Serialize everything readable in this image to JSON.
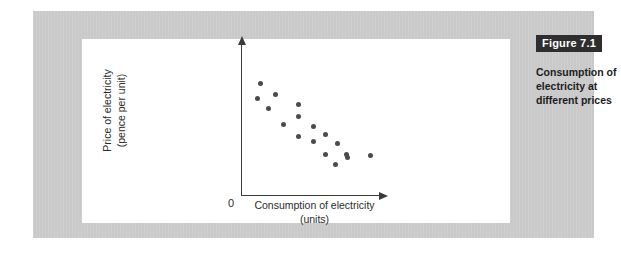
{
  "figure": {
    "badge_label": "Figure 7.1",
    "caption": "Consumption of electricity at different prices"
  },
  "colors": {
    "panel_gray": "#c9c9c9",
    "card_white": "#ffffff",
    "badge_bg": "#2e2e2e",
    "badge_text": "#ffffff",
    "dot": "#4b4b4f",
    "axis": "#3a3a3a",
    "text": "#2b2b2b"
  },
  "chart_data": {
    "type": "scatter",
    "title": "",
    "xlabel": "Consumption of electricity (units)",
    "ylabel": "Price of electricity (pence per unit)",
    "xlabel_line1": "Consumption of electricity",
    "xlabel_line2": "(units)",
    "ylabel_line1": "Price of electricity",
    "ylabel_line2": "(pence per unit)",
    "origin_label": "0",
    "grid": false,
    "legend": null,
    "xlim": [
      0,
      100
    ],
    "ylim": [
      0,
      100
    ],
    "axis_ticks": [],
    "series": [
      {
        "name": "Observed price/consumption pairs",
        "marker": "circle",
        "color": "#4b4b4f",
        "points": [
          {
            "x": 13.5,
            "y": 89.0
          },
          {
            "x": 11.5,
            "y": 77.0
          },
          {
            "x": 24.5,
            "y": 80.5
          },
          {
            "x": 19.5,
            "y": 69.0
          },
          {
            "x": 30.5,
            "y": 56.5
          },
          {
            "x": 41.0,
            "y": 72.5
          },
          {
            "x": 41.0,
            "y": 62.5
          },
          {
            "x": 52.0,
            "y": 54.5
          },
          {
            "x": 61.0,
            "y": 48.5
          },
          {
            "x": 41.5,
            "y": 47.0
          },
          {
            "x": 52.0,
            "y": 42.5
          },
          {
            "x": 69.5,
            "y": 41.0
          },
          {
            "x": 60.5,
            "y": 32.5
          },
          {
            "x": 76.5,
            "y": 30.0
          },
          {
            "x": 68.0,
            "y": 24.5
          },
          {
            "x": 76.0,
            "y": 32.5
          },
          {
            "x": 93.5,
            "y": 31.5
          }
        ]
      }
    ]
  }
}
